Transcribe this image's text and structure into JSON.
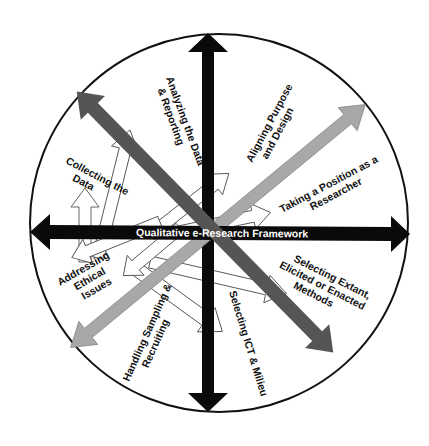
{
  "diagram": {
    "title": "Qualitative e-Research Framework",
    "colors": {
      "background": "#ffffff",
      "circle_stroke": "#111111",
      "primary_axis": "#0a0a0a",
      "dark_diagonal": "#555555",
      "light_diagonal": "#a8a8a8",
      "outline_arrow_fill": "#ffffff",
      "outline_arrow_stroke": "#555555"
    },
    "center_label": "Qualitative e-Research Framework",
    "components": [
      {
        "id": "aligning",
        "line1": "Aligning Purpose",
        "line2": "and Design"
      },
      {
        "id": "position",
        "line1": "Taking a Position as a",
        "line2": "Researcher"
      },
      {
        "id": "selecting_methods",
        "line1": "Selecting Extant,",
        "line2": "Elicited or Enacted",
        "line3": "Methods"
      },
      {
        "id": "ict",
        "line1": "Selecting ICT & Milieu"
      },
      {
        "id": "sampling",
        "line1": "Handling Sampling &",
        "line2": "Recruiting"
      },
      {
        "id": "ethics",
        "line1": "Addressing",
        "line2": "Ethical",
        "line3": "Issues"
      },
      {
        "id": "collecting",
        "line1": "Collecting the",
        "line2": "Data"
      },
      {
        "id": "analyzing",
        "line1": "Analyzing the Data",
        "line2": "& Reporting"
      }
    ]
  }
}
